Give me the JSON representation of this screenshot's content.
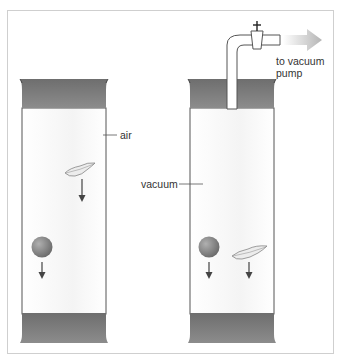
{
  "labels": {
    "air": "air",
    "vacuum": "vacuum",
    "pump_line1": "to vacuum",
    "pump_line2": "pump"
  },
  "valve_symbol": "+",
  "colors": {
    "cap": "#7d7d7d",
    "tube_outline": "#555555",
    "ball": "#8a8a8a",
    "arrow": "#444444",
    "frame": "#cfcfcf"
  }
}
